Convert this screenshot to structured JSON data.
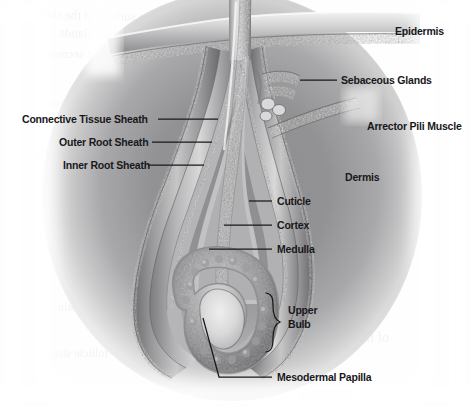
{
  "figure": {
    "type": "anatomical-illustration",
    "style": "grayscale airbrush halftone",
    "background_color": "#ffffff",
    "ink_color": "#18181a"
  },
  "labels": [
    {
      "id": "epidermis",
      "text": "Epidermis",
      "x": 395,
      "y": 25,
      "align": "left",
      "leader": false
    },
    {
      "id": "sebaceous-glands",
      "text": "Sebaceous Glands",
      "x": 341,
      "y": 74,
      "align": "left",
      "leader": true
    },
    {
      "id": "arrector-pili",
      "text": "Arrector Pili Muscle",
      "x": 367,
      "y": 120,
      "align": "left",
      "leader": false
    },
    {
      "id": "connective-tissue",
      "text": "Connective Tissue Sheath",
      "x": 22,
      "y": 115,
      "align": "left",
      "leader": true
    },
    {
      "id": "outer-root-sheath",
      "text": "Outer Root Sheath",
      "x": 59,
      "y": 138,
      "align": "left",
      "leader": true
    },
    {
      "id": "inner-root-sheath",
      "text": "Inner Root Sheath",
      "x": 63,
      "y": 161,
      "align": "left",
      "leader": true
    },
    {
      "id": "dermis",
      "text": "Dermis",
      "x": 345,
      "y": 171,
      "align": "left",
      "leader": false
    },
    {
      "id": "cuticle",
      "text": "Cuticle",
      "x": 277,
      "y": 197,
      "align": "left",
      "leader": true
    },
    {
      "id": "cortex",
      "text": "Cortex",
      "x": 277,
      "y": 221,
      "align": "left",
      "leader": true
    },
    {
      "id": "medulla",
      "text": "Medulla",
      "x": 277,
      "y": 245,
      "align": "left",
      "leader": true
    },
    {
      "id": "upper-bulb-line1",
      "text": "Upper",
      "x": 288,
      "y": 310,
      "align": "left",
      "leader": false
    },
    {
      "id": "upper-bulb-line2",
      "text": "Bulb",
      "x": 288,
      "y": 323,
      "align": "left",
      "leader": false
    },
    {
      "id": "mesodermal-papilla",
      "text": "Mesodermal Papilla",
      "x": 277,
      "y": 373,
      "align": "left",
      "leader": true
    }
  ],
  "brace": {
    "id": "upper-bulb-brace",
    "label": "Upper Bulb",
    "x": 268,
    "y_top": 293,
    "y_bottom": 352
  },
  "structures": [
    {
      "id": "hair-shaft",
      "name": "Hair Shaft"
    },
    {
      "id": "epidermis-layer",
      "name": "Epidermis"
    },
    {
      "id": "dermis-field",
      "name": "Dermis"
    },
    {
      "id": "sebaceous-gland-body",
      "name": "Sebaceous Glands"
    },
    {
      "id": "arrector-pili-band",
      "name": "Arrector Pili Muscle"
    },
    {
      "id": "connective-sheath",
      "name": "Connective Tissue Sheath"
    },
    {
      "id": "outer-root-sheath",
      "name": "Outer Root Sheath"
    },
    {
      "id": "inner-root-sheath",
      "name": "Inner Root Sheath"
    },
    {
      "id": "cuticle-layer",
      "name": "Cuticle"
    },
    {
      "id": "cortex-layer",
      "name": "Cortex"
    },
    {
      "id": "medulla-core",
      "name": "Medulla"
    },
    {
      "id": "hair-bulb-matrix",
      "name": "Hair Bulb Matrix"
    },
    {
      "id": "mesodermal-papilla",
      "name": "Mesodermal Papilla"
    }
  ],
  "show_through": [
    {
      "text": "and the surface of the skin",
      "x": 40,
      "y": 8,
      "size": 13,
      "rot": -1.2
    },
    {
      "text": "sebaceous and sweat glands",
      "x": 60,
      "y": 26,
      "size": 13,
      "rot": -0.6
    },
    {
      "text": "that secrete",
      "x": 48,
      "y": 46,
      "size": 13,
      "rot": -0.4
    },
    {
      "text": "hair grows from",
      "x": 44,
      "y": 96,
      "size": 12,
      "rot": 0.3
    },
    {
      "text": "of the follicle",
      "x": 36,
      "y": 148,
      "size": 12,
      "rot": 0.2
    },
    {
      "text": "the dermis and",
      "x": 300,
      "y": 232,
      "size": 13,
      "rot": 0.4
    },
    {
      "text": "Curly",
      "x": 352,
      "y": 246,
      "size": 17,
      "rot": 0
    },
    {
      "text": "keratin",
      "x": 58,
      "y": 300,
      "size": 12,
      "rot": 0.5
    },
    {
      "text": "of hair",
      "x": 352,
      "y": 330,
      "size": 14,
      "rot": 0
    },
    {
      "text": "follicle shape",
      "x": 44,
      "y": 346,
      "size": 12,
      "rot": 0.2
    },
    {
      "text": "determines",
      "x": 300,
      "y": 386,
      "size": 12,
      "rot": 0.3
    }
  ]
}
